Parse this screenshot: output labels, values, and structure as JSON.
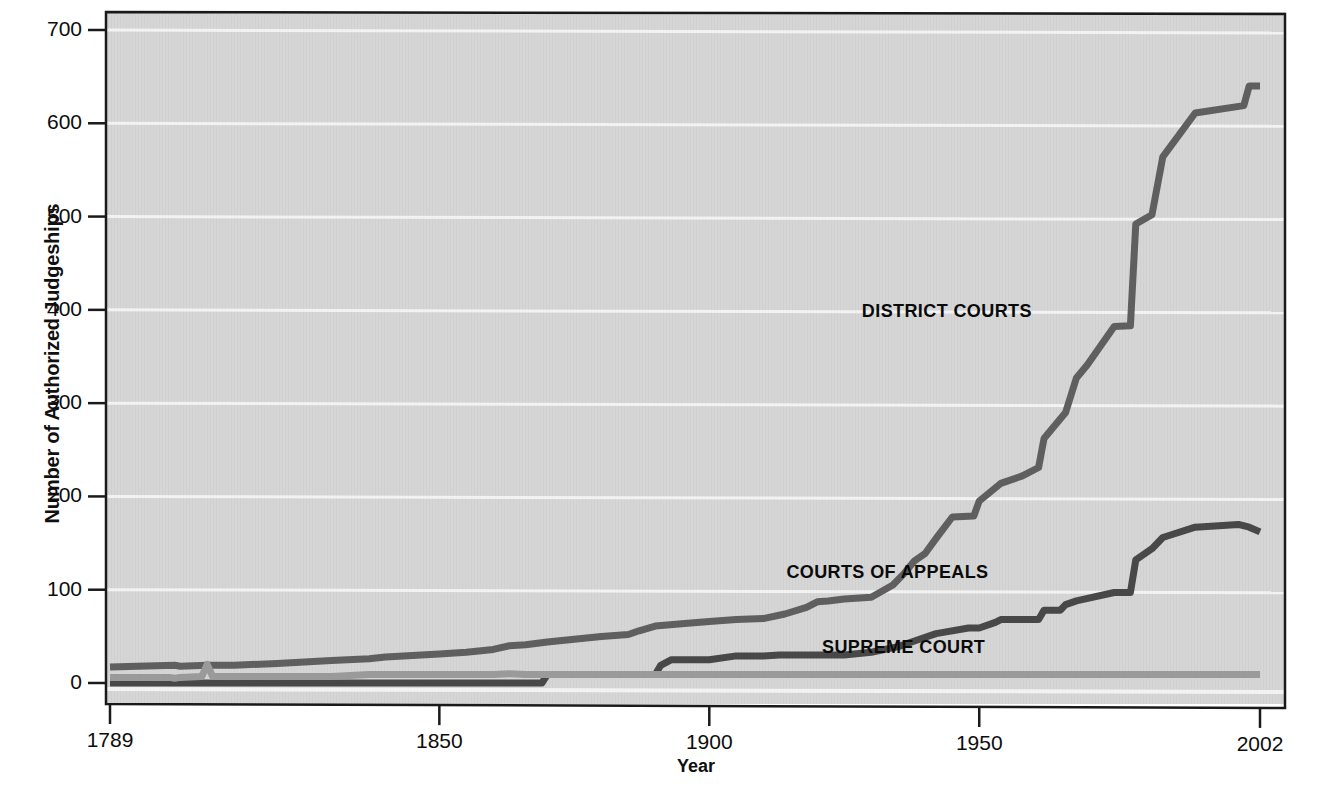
{
  "chart_data": {
    "type": "line",
    "title": "",
    "xlabel": "Year",
    "ylabel": "Number of Authorized Judgeships",
    "xlim": [
      1789,
      2002
    ],
    "ylim": [
      0,
      700
    ],
    "grid": true,
    "legend_position": "inline-annotations",
    "y_ticks": [
      0,
      100,
      200,
      300,
      400,
      500,
      600,
      700
    ],
    "y_tick_labels": [
      "0",
      "100",
      "200",
      "300",
      "400",
      "500",
      "600",
      "700"
    ],
    "x_ticks": [
      1789,
      1850,
      1900,
      1950,
      2002
    ],
    "x_tick_labels": [
      "1789",
      "1850",
      "1900",
      "1950",
      "2002"
    ],
    "series": [
      {
        "name": "DISTRICT COURTS",
        "color": "#5f5f5f",
        "label_x": 1944,
        "label_y": 398,
        "points": [
          [
            1789,
            17
          ],
          [
            1801,
            19
          ],
          [
            1802,
            18
          ],
          [
            1807,
            19
          ],
          [
            1812,
            19
          ],
          [
            1820,
            21
          ],
          [
            1830,
            24
          ],
          [
            1837,
            26
          ],
          [
            1840,
            28
          ],
          [
            1850,
            31
          ],
          [
            1855,
            33
          ],
          [
            1860,
            36
          ],
          [
            1863,
            40
          ],
          [
            1866,
            41
          ],
          [
            1870,
            44
          ],
          [
            1875,
            47
          ],
          [
            1880,
            50
          ],
          [
            1885,
            52
          ],
          [
            1887,
            56
          ],
          [
            1890,
            61
          ],
          [
            1896,
            64
          ],
          [
            1900,
            66
          ],
          [
            1905,
            68
          ],
          [
            1910,
            69
          ],
          [
            1914,
            74
          ],
          [
            1918,
            81
          ],
          [
            1920,
            87
          ],
          [
            1922,
            88
          ],
          [
            1925,
            90
          ],
          [
            1930,
            92
          ],
          [
            1934,
            105
          ],
          [
            1936,
            117
          ],
          [
            1938,
            131
          ],
          [
            1940,
            139
          ],
          [
            1942,
            155
          ],
          [
            1945,
            178
          ],
          [
            1949,
            179
          ],
          [
            1950,
            195
          ],
          [
            1954,
            214
          ],
          [
            1958,
            222
          ],
          [
            1961,
            231
          ],
          [
            1962,
            262
          ],
          [
            1966,
            290
          ],
          [
            1968,
            327
          ],
          [
            1970,
            341
          ],
          [
            1975,
            382
          ],
          [
            1978,
            383
          ],
          [
            1979,
            492
          ],
          [
            1982,
            502
          ],
          [
            1984,
            564
          ],
          [
            1990,
            611
          ],
          [
            1999,
            619
          ],
          [
            2000,
            640
          ],
          [
            2002,
            640
          ]
        ]
      },
      {
        "name": "COURTS OF APPEALS",
        "color": "#484848",
        "label_x": 1933,
        "label_y": 118,
        "points": [
          [
            1789,
            0
          ],
          [
            1850,
            0
          ],
          [
            1865,
            0
          ],
          [
            1869,
            0
          ],
          [
            1870,
            9
          ],
          [
            1880,
            9
          ],
          [
            1890,
            9
          ],
          [
            1891,
            19
          ],
          [
            1893,
            25
          ],
          [
            1895,
            25
          ],
          [
            1900,
            25
          ],
          [
            1905,
            29
          ],
          [
            1910,
            29
          ],
          [
            1913,
            30
          ],
          [
            1925,
            30
          ],
          [
            1930,
            33
          ],
          [
            1935,
            39
          ],
          [
            1938,
            45
          ],
          [
            1940,
            49
          ],
          [
            1942,
            53
          ],
          [
            1948,
            59
          ],
          [
            1950,
            59
          ],
          [
            1953,
            65
          ],
          [
            1954,
            68
          ],
          [
            1961,
            68
          ],
          [
            1962,
            78
          ],
          [
            1965,
            78
          ],
          [
            1966,
            84
          ],
          [
            1968,
            88
          ],
          [
            1975,
            97
          ],
          [
            1978,
            97
          ],
          [
            1979,
            132
          ],
          [
            1982,
            144
          ],
          [
            1984,
            156
          ],
          [
            1990,
            167
          ],
          [
            1998,
            170
          ],
          [
            2000,
            167
          ],
          [
            2002,
            162
          ]
        ]
      },
      {
        "name": "SUPREME COURT",
        "color": "#9a9a9a",
        "label_x": 1936,
        "label_y": 38,
        "points": [
          [
            1789,
            6
          ],
          [
            1800,
            6
          ],
          [
            1801,
            5
          ],
          [
            1802,
            6
          ],
          [
            1806,
            7
          ],
          [
            1807,
            20
          ],
          [
            1808,
            7
          ],
          [
            1830,
            7
          ],
          [
            1837,
            9
          ],
          [
            1850,
            9
          ],
          [
            1860,
            9
          ],
          [
            1863,
            10
          ],
          [
            1866,
            9
          ],
          [
            1869,
            9
          ],
          [
            1880,
            9
          ],
          [
            1900,
            9
          ],
          [
            1950,
            9
          ],
          [
            2002,
            9
          ]
        ]
      }
    ]
  },
  "axes": {
    "y_title": "Number of Authorized Judgeships",
    "x_title": "Year"
  },
  "labels": {
    "district_courts": "DISTRICT COURTS",
    "courts_of_appeals": "COURTS OF APPEALS",
    "supreme_court": "SUPREME COURT"
  },
  "colors": {
    "plot_background": "#d6d6d6",
    "gridline": "#f2f2f2",
    "axis": "#1a1a1a",
    "district_courts": "#5f5f5f",
    "courts_of_appeals": "#484848",
    "supreme_court": "#9a9a9a"
  }
}
